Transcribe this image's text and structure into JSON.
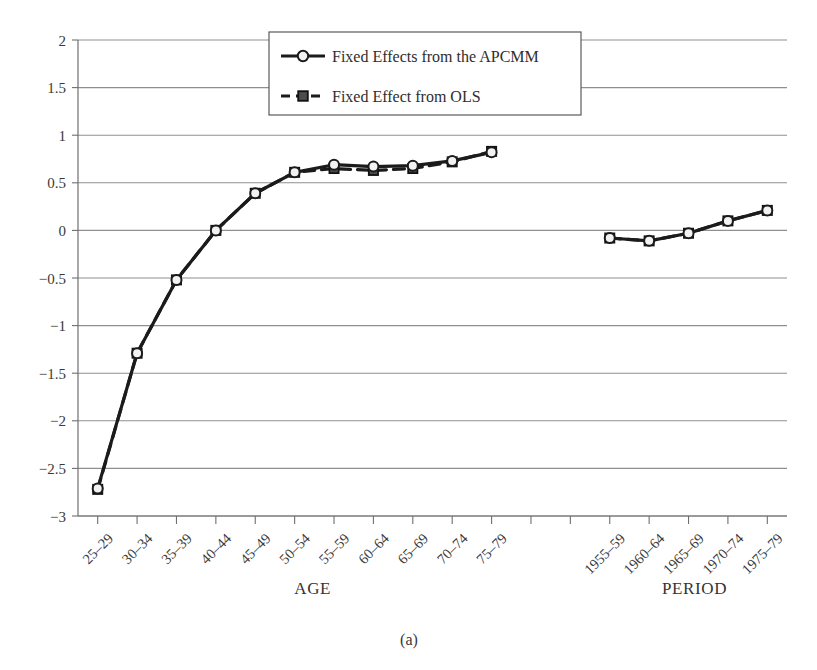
{
  "figure": {
    "caption": "(a)",
    "axis_titles": {
      "age": "AGE",
      "period": "PERIOD"
    }
  },
  "legend": {
    "entries": [
      {
        "label": "Fixed Effects from the APCMM",
        "marker": "open-circle",
        "line": "solid",
        "color": "#1b1b1b"
      },
      {
        "label": "Fixed Effect from OLS",
        "marker": "filled-square",
        "line": "dashed",
        "color": "#1b1b1b"
      }
    ]
  },
  "chart_data": {
    "type": "line",
    "title": "",
    "subtitle": "",
    "xlabel": "AGE / PERIOD",
    "ylabel": "",
    "ylim": [
      -3,
      2
    ],
    "yticks": [
      2,
      1.5,
      1,
      0.5,
      0,
      -0.5,
      -1,
      -1.5,
      -2,
      -2.5,
      -3
    ],
    "ytick_labels": [
      "2",
      "1.5",
      "1",
      "0.5",
      "0",
      "−0.5",
      "−1",
      "−1.5",
      "−2",
      "−2.5",
      "−3"
    ],
    "grid": true,
    "grid_orientation": "horizontal",
    "legend_position": "top-center",
    "groups": [
      {
        "name": "AGE",
        "categories": [
          "25–29",
          "30–34",
          "35–39",
          "40–44",
          "45–49",
          "50–54",
          "55–59",
          "60–64",
          "65–69",
          "70–74",
          "75–79"
        ]
      },
      {
        "name": "PERIOD",
        "categories": [
          "1955–59",
          "1960–64",
          "1965–69",
          "1970–74",
          "1975–79"
        ]
      }
    ],
    "series": [
      {
        "name": "Fixed Effects from the APCMM",
        "marker": "open-circle",
        "line": "solid",
        "age_values": [
          -2.71,
          -1.29,
          -0.52,
          0.0,
          0.39,
          0.61,
          0.69,
          0.67,
          0.68,
          0.73,
          0.82
        ],
        "period_values": [
          -0.08,
          -0.11,
          -0.03,
          0.1,
          0.21
        ]
      },
      {
        "name": "Fixed Effect from OLS",
        "marker": "filled-square",
        "line": "dashed",
        "age_values": [
          -2.72,
          -1.29,
          -0.52,
          0.0,
          0.39,
          0.61,
          0.65,
          0.63,
          0.65,
          0.72,
          0.83
        ],
        "period_values": [
          -0.08,
          -0.11,
          -0.03,
          0.1,
          0.21
        ]
      }
    ]
  }
}
